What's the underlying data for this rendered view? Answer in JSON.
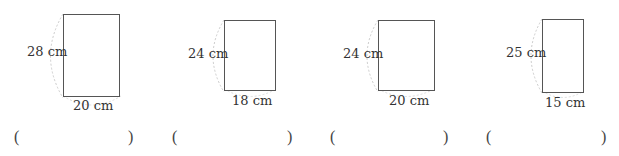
{
  "problems": [
    {
      "height_label": "28 cm",
      "width_label": "20 cm",
      "open_paren": "(",
      "close_paren": ")",
      "answer": ""
    },
    {
      "height_label": "24 cm",
      "width_label": "18 cm",
      "open_paren": "(",
      "close_paren": ")",
      "answer": ""
    },
    {
      "height_label": "24 cm",
      "width_label": "20 cm",
      "open_paren": "(",
      "close_paren": ")",
      "answer": ""
    },
    {
      "height_label": "25 cm",
      "width_label": "15 cm",
      "open_paren": "(",
      "close_paren": ")",
      "answer": ""
    }
  ]
}
